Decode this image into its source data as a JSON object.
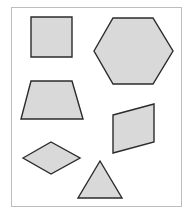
{
  "figure": {
    "fill_color": "#d9d9d9",
    "stroke_color": "#2b2b2b",
    "frame_color": "#bdbdbd",
    "shapes": [
      {
        "name": "square",
        "points": "31,17 72,17 72,57 31,57"
      },
      {
        "name": "hexagon",
        "points": "94,51 113,18 153,18 173,51 153,84 113,84"
      },
      {
        "name": "trapezoid",
        "points": "31,81 72,81 83,119 21,119"
      },
      {
        "name": "parallelogram",
        "points": "113,115 154,104 154,142 113,153"
      },
      {
        "name": "rhombus",
        "points": "23,158 51,142 80,158 51,174"
      },
      {
        "name": "triangle",
        "points": "100,161 122,198 78,198"
      }
    ]
  }
}
